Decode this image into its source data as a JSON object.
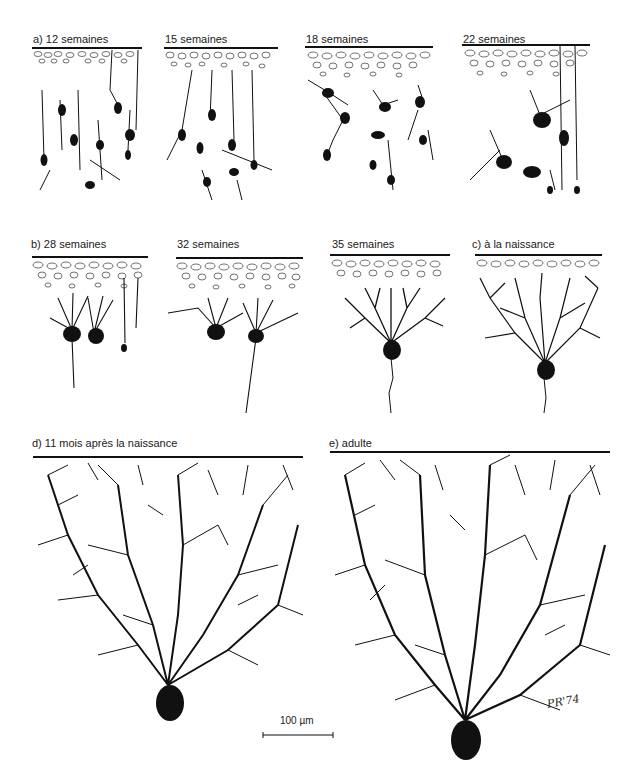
{
  "figure": {
    "ink_color": "#111111",
    "background": "#ffffff"
  },
  "row_a": {
    "panels": [
      {
        "label": "a) 12 semaines"
      },
      {
        "label": "15 semaines"
      },
      {
        "label": "18 semaines"
      },
      {
        "label": "22 semaines"
      }
    ]
  },
  "row_b": {
    "panels": [
      {
        "label": "b) 28 semaines"
      },
      {
        "label": "32 semaines"
      },
      {
        "label": "35 semaines"
      },
      {
        "label": "c)  à la naissance"
      }
    ]
  },
  "row_c": {
    "panels": [
      {
        "label": "d)  11 mois après la naissance"
      },
      {
        "label": "e)  adulte"
      }
    ]
  },
  "scale_bar": {
    "label": "100 µm"
  },
  "signature": "PR'74"
}
